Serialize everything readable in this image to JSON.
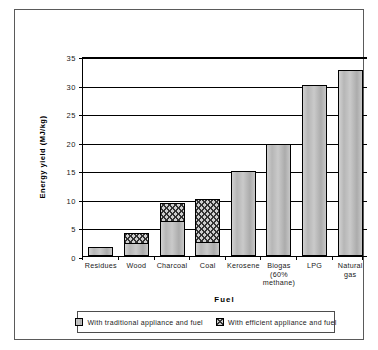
{
  "chart_data": {
    "type": "bar",
    "stacked": true,
    "title": "",
    "xlabel": "Fuel",
    "ylabel": "Energy  yield   (MJ/kg)",
    "categories": [
      "Residues",
      "Wood",
      "Charcoal",
      "Coal",
      "Kerosene",
      "Biogas\n(60%\nmethane)",
      "LPG",
      "Natural\ngas"
    ],
    "series": [
      {
        "name": "With traditional appliance and fuel",
        "swatch": "#b5b5b5",
        "pattern": "solid-shaded",
        "values": [
          1.5,
          2.3,
          6.1,
          2.4,
          14.9,
          19.6,
          30.0,
          32.5
        ]
      },
      {
        "name": "With efficient appliance and fuel",
        "swatch": "#cfcfcf",
        "pattern": "cross-hatch",
        "values": [
          0,
          1.7,
          3.1,
          7.5,
          0,
          0,
          0,
          0
        ]
      }
    ],
    "totals": [
      1.5,
      4.0,
      9.2,
      9.9,
      14.9,
      19.6,
      30.0,
      32.5
    ],
    "ylim": [
      0,
      35
    ],
    "yticks": [
      0,
      5,
      10,
      15,
      20,
      25,
      30,
      35
    ],
    "ytick_labels": [
      "0",
      "5",
      "10",
      "15",
      "20",
      "25",
      "30",
      "35"
    ],
    "grid": "horizontal",
    "legend_position": "bottom"
  },
  "legend": {
    "entries": [
      {
        "label": "With traditional appliance and fuel"
      },
      {
        "label": "With efficient appliance and fuel"
      }
    ]
  }
}
